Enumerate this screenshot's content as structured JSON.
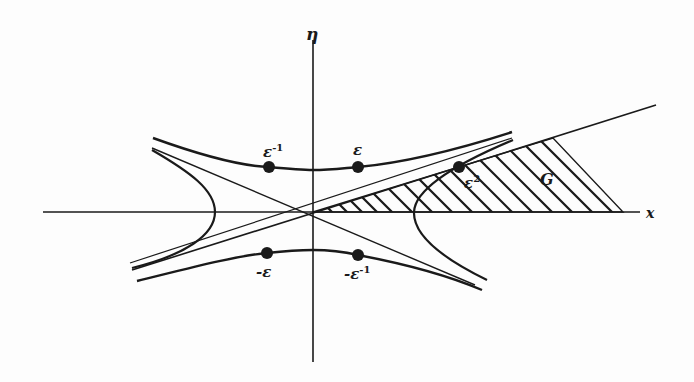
{
  "diagram": {
    "axes": {
      "x_label": "x",
      "y_label": "η"
    },
    "region": {
      "label": "G",
      "fill": "hatched"
    },
    "points": [
      {
        "id": "eps-inv",
        "label": "ε",
        "sup": "-1"
      },
      {
        "id": "eps",
        "label": "ε",
        "sup": ""
      },
      {
        "id": "neg-eps",
        "label": "-ε",
        "sup": ""
      },
      {
        "id": "neg-eps-inv",
        "label": "-ε",
        "sup": "-1"
      },
      {
        "id": "eps-sq",
        "label": "ε",
        "sup": "2"
      }
    ],
    "colors": {
      "ink": "#1a1a1a",
      "paper": "#fdfdfd"
    }
  }
}
